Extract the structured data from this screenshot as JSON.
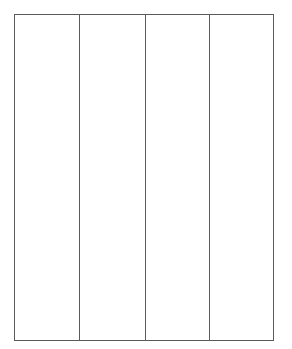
{
  "header": {
    "text": ""
  },
  "grid": {
    "columns": [
      {
        "label": "",
        "cells": []
      },
      {
        "label": "",
        "cells": []
      },
      {
        "label": "",
        "cells": []
      },
      {
        "label": "",
        "cells": []
      }
    ],
    "line_color": "#5a5a5a",
    "background": "#ffffff"
  }
}
